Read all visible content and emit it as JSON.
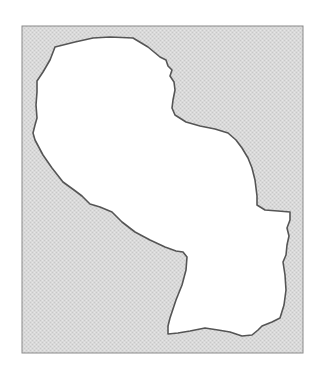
{
  "map": {
    "subject": "country-outline",
    "colors": {
      "page_background": "#ffffff",
      "frame_fill": "#d9d9d9",
      "stipple_light": "#e6e6e6",
      "stipple_dark": "#c8c8c8",
      "frame_border": "#8a8a8a",
      "region_fill": "#ffffff",
      "region_border": "#555555"
    },
    "frame": {
      "x": 22,
      "y": 26,
      "width": 281,
      "height": 327
    },
    "region_outline_points": [
      [
        55,
        47
      ],
      [
        75,
        42
      ],
      [
        93,
        38
      ],
      [
        110,
        37
      ],
      [
        133,
        38
      ],
      [
        148,
        47
      ],
      [
        160,
        57
      ],
      [
        166,
        60
      ],
      [
        168,
        66
      ],
      [
        172,
        70
      ],
      [
        170,
        76
      ],
      [
        174,
        82
      ],
      [
        175,
        90
      ],
      [
        173,
        100
      ],
      [
        172,
        108
      ],
      [
        175,
        115
      ],
      [
        186,
        122
      ],
      [
        200,
        126
      ],
      [
        215,
        129
      ],
      [
        228,
        133
      ],
      [
        236,
        140
      ],
      [
        242,
        148
      ],
      [
        248,
        158
      ],
      [
        252,
        168
      ],
      [
        255,
        180
      ],
      [
        257,
        196
      ],
      [
        257,
        205
      ],
      [
        265,
        210
      ],
      [
        278,
        211
      ],
      [
        290,
        212
      ],
      [
        290,
        220
      ],
      [
        287,
        228
      ],
      [
        289,
        236
      ],
      [
        287,
        245
      ],
      [
        286,
        255
      ],
      [
        283,
        262
      ],
      [
        285,
        275
      ],
      [
        286,
        290
      ],
      [
        284,
        305
      ],
      [
        280,
        318
      ],
      [
        272,
        322
      ],
      [
        262,
        326
      ],
      [
        258,
        330
      ],
      [
        252,
        335
      ],
      [
        242,
        336
      ],
      [
        230,
        332
      ],
      [
        218,
        330
      ],
      [
        205,
        328
      ],
      [
        190,
        331
      ],
      [
        178,
        333
      ],
      [
        168,
        334
      ],
      [
        168,
        326
      ],
      [
        170,
        318
      ],
      [
        176,
        300
      ],
      [
        182,
        285
      ],
      [
        186,
        270
      ],
      [
        187,
        257
      ],
      [
        183,
        252
      ],
      [
        176,
        251
      ],
      [
        165,
        247
      ],
      [
        150,
        240
      ],
      [
        135,
        232
      ],
      [
        122,
        222
      ],
      [
        112,
        212
      ],
      [
        100,
        207
      ],
      [
        90,
        204
      ],
      [
        82,
        196
      ],
      [
        74,
        190
      ],
      [
        63,
        182
      ],
      [
        52,
        168
      ],
      [
        43,
        155
      ],
      [
        35,
        140
      ],
      [
        33,
        133
      ],
      [
        35,
        125
      ],
      [
        37,
        118
      ],
      [
        36,
        105
      ],
      [
        37,
        92
      ],
      [
        37,
        81
      ],
      [
        43,
        72
      ],
      [
        50,
        60
      ],
      [
        55,
        47
      ]
    ]
  }
}
